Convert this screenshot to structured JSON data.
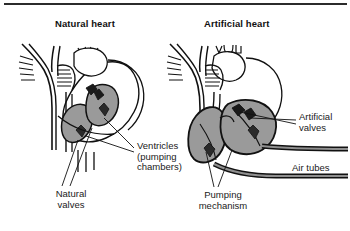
{
  "figure": {
    "type": "medical-illustration",
    "panels": [
      {
        "id": "natural",
        "heading": "Natural heart",
        "labels": [
          "Ventricles (pumping chambers)",
          "Natural valves"
        ]
      },
      {
        "id": "artificial",
        "heading": "Artificial heart",
        "labels": [
          "Artificial valves",
          "Air tubes",
          "Pumping mechanism"
        ]
      }
    ]
  },
  "headings": {
    "natural": "Natural heart",
    "artificial": "Artificial heart"
  },
  "labels": {
    "ventricles": "Ventricles\n(pumping\nchambers)",
    "natural_valves": "Natural\nvalves",
    "pumping_mechanism": "Pumping\nmechanism",
    "artificial_valves": "Artificial\nvalves",
    "air_tubes": "Air tubes"
  },
  "colors": {
    "background": "#ffffff",
    "ink": "#111111",
    "rule": "#2b2b2b",
    "chamber_fill": "#9a9a9a",
    "tube_fill": "#8f8f8f",
    "vessel_fill": "#ffffff"
  }
}
